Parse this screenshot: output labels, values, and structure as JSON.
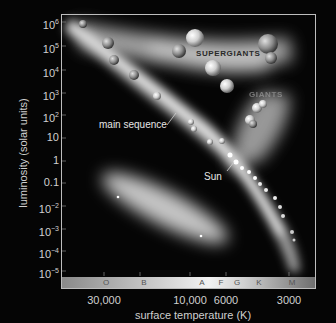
{
  "axes": {
    "y_label": "luminosity (solar units)",
    "x_label": "surface temperature (K)",
    "y_ticks": [
      {
        "base": "10",
        "exp": "6",
        "y": 22
      },
      {
        "base": "10",
        "exp": "5",
        "y": 46
      },
      {
        "base": "10",
        "exp": "4",
        "y": 70
      },
      {
        "base": "10",
        "exp": "3",
        "y": 93
      },
      {
        "base": "10",
        "exp": "2",
        "y": 115
      },
      {
        "base": "10",
        "exp": "",
        "y": 138
      },
      {
        "base": "1",
        "exp": "",
        "y": 161
      },
      {
        "base": "0.1",
        "exp": "",
        "y": 183
      },
      {
        "base": "10",
        "exp": "−2",
        "y": 206
      },
      {
        "base": "10",
        "exp": "−3",
        "y": 229
      },
      {
        "base": "10",
        "exp": "−4",
        "y": 251
      },
      {
        "base": "10",
        "exp": "−5",
        "y": 271
      }
    ],
    "x_ticks": [
      {
        "label": "30,000",
        "x": 104
      },
      {
        "label": "10,000",
        "x": 190
      },
      {
        "label": "6000",
        "x": 226
      },
      {
        "label": "3000",
        "x": 289
      }
    ]
  },
  "spectral_classes": [
    {
      "label": "O",
      "x": 106
    },
    {
      "label": "B",
      "x": 144
    },
    {
      "label": "A",
      "x": 202
    },
    {
      "label": "F",
      "x": 221
    },
    {
      "label": "G",
      "x": 237
    },
    {
      "label": "K",
      "x": 259
    },
    {
      "label": "M",
      "x": 292
    }
  ],
  "regions": {
    "supergiants": "SUPERGIANTS",
    "giants": "GIANTS",
    "main_sequence": "main sequence",
    "sun": "Sun"
  },
  "colors": {
    "background": "#050505",
    "frame": "#bdbdbd",
    "glow": "#ffffff",
    "band_left": "#8a8a8a",
    "band_mid": "#f0f0f0",
    "band_right": "#777777"
  }
}
